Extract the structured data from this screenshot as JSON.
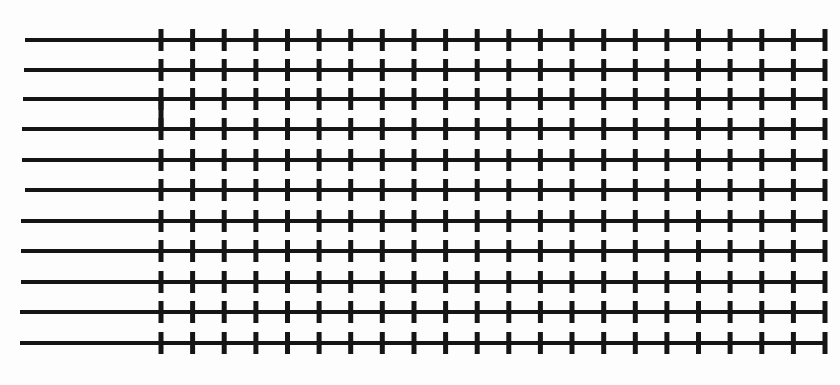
{
  "diagram": {
    "type": "line-array-with-ticks",
    "background": "#fdfdfd",
    "stroke_color": "#151515",
    "line_width": 4,
    "tick_width": 5,
    "tick_half_height": 11,
    "row_count": 11,
    "tick_start_x": 161,
    "tick_end_x": 825,
    "tick_count": 22,
    "rows": [
      {
        "y": 40,
        "x_start": 25
      },
      {
        "y": 70,
        "x_start": 24
      },
      {
        "y": 99,
        "x_start": 23
      },
      {
        "y": 129,
        "x_start": 22
      },
      {
        "y": 160,
        "x_start": 22
      },
      {
        "y": 190,
        "x_start": 25
      },
      {
        "y": 221,
        "x_start": 21
      },
      {
        "y": 251,
        "x_start": 21
      },
      {
        "y": 282,
        "x_start": 21
      },
      {
        "y": 312,
        "x_start": 20
      },
      {
        "y": 343,
        "x_start": 20
      }
    ],
    "connectors": [
      {
        "x": 161,
        "y_from": 99,
        "y_to": 129
      }
    ]
  }
}
